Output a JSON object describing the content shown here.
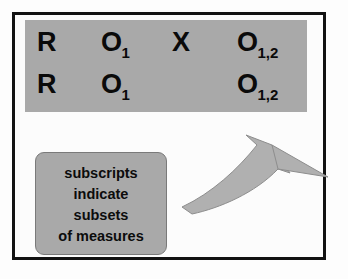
{
  "figure": {
    "frame_color": "#121212",
    "panel_color": "#a9a9a9",
    "text_color": "#0a0a0a"
  },
  "notation": {
    "rows": [
      {
        "cells": [
          {
            "symbol": "R",
            "subscript": ""
          },
          {
            "symbol": "O",
            "subscript": "1"
          },
          {
            "symbol": "X",
            "subscript": ""
          },
          {
            "symbol": "O",
            "subscript": "1,2"
          }
        ]
      },
      {
        "cells": [
          {
            "symbol": "R",
            "subscript": ""
          },
          {
            "symbol": "O",
            "subscript": "1"
          },
          {
            "symbol": "",
            "subscript": ""
          },
          {
            "symbol": "O",
            "subscript": "1,2"
          }
        ]
      }
    ]
  },
  "caption": {
    "lines": [
      "subscripts",
      "indicate",
      "subsets",
      "of measures"
    ]
  },
  "arrow": {
    "name": "curved-arrow",
    "direction": "up-right",
    "fill": "#b0b0b0",
    "stroke": "#8a8a8a"
  }
}
